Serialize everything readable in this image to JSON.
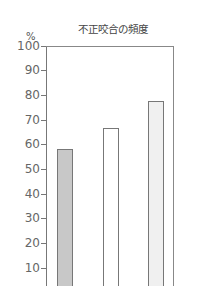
{
  "chart_data": {
    "type": "bar",
    "title": "不正咬合の頻度",
    "ylabel": "%",
    "xlabel": "",
    "ylim": [
      0,
      100
    ],
    "yticks": [
      10,
      20,
      30,
      40,
      50,
      60,
      70,
      80,
      90,
      100
    ],
    "categories": [
      "",
      "",
      ""
    ],
    "values": [
      58,
      66.5,
      77.5
    ],
    "bar_colors": [
      "#c8c8c8",
      "#ffffff",
      "#f0f0f0"
    ],
    "grid": false,
    "legend": null
  },
  "labels": {
    "title": "不正咬合の頻度",
    "unit": "%",
    "ticks": [
      "100",
      "90",
      "80",
      "70",
      "60",
      "50",
      "40",
      "30",
      "20",
      "10"
    ]
  }
}
